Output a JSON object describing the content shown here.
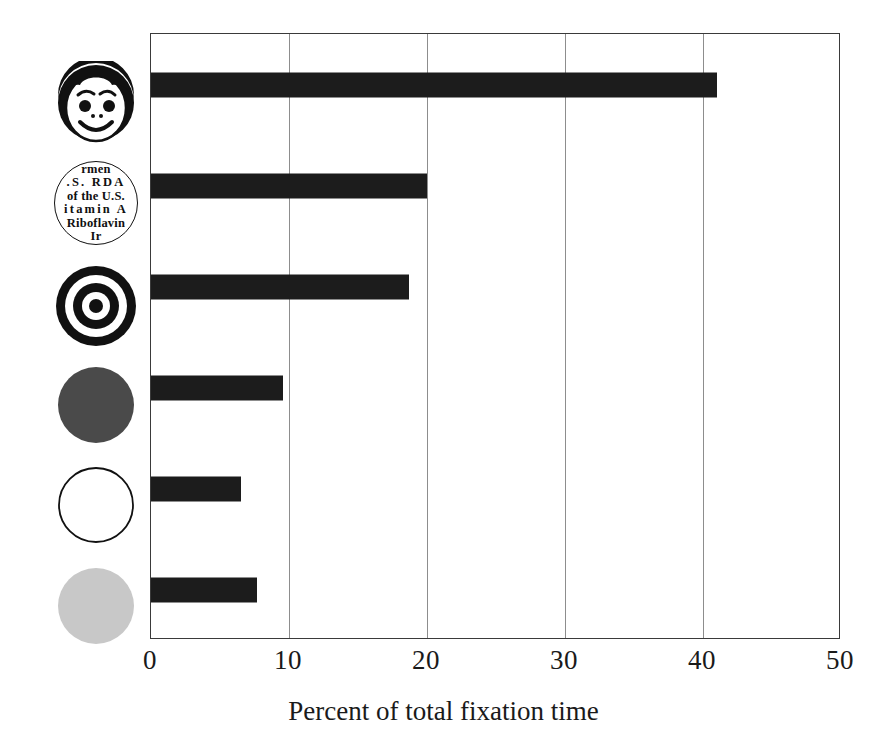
{
  "chart_data": {
    "type": "bar",
    "orientation": "horizontal",
    "title": "",
    "xlabel": "Percent of total fixation time",
    "ylabel": "",
    "xlim": [
      0,
      50
    ],
    "xticks": [
      0,
      10,
      20,
      30,
      40,
      50
    ],
    "xtick_labels": [
      "0",
      "10",
      "20",
      "30",
      "40",
      "50"
    ],
    "grid": "vertical",
    "legend": "none",
    "bar_color": "#1c1c1c",
    "categories": [
      "smiling-face",
      "nutrition-label",
      "bullseye-target",
      "dark-gray-circle",
      "white-circle",
      "light-gray-circle"
    ],
    "values": [
      41.0,
      20.0,
      18.7,
      9.6,
      6.5,
      7.7
    ],
    "bars": [
      {
        "category": "smiling-face",
        "value": 41.0,
        "icon": "smiling-face-icon"
      },
      {
        "category": "nutrition-label",
        "value": 20.0,
        "icon": "nutrition-label-icon"
      },
      {
        "category": "bullseye-target",
        "value": 18.7,
        "icon": "bullseye-target-icon"
      },
      {
        "category": "dark-gray-circle",
        "value": 9.6,
        "icon": "dark-gray-circle-icon"
      },
      {
        "category": "white-circle",
        "value": 6.5,
        "icon": "white-circle-icon"
      },
      {
        "category": "light-gray-circle",
        "value": 7.7,
        "icon": "light-gray-circle-icon"
      }
    ]
  },
  "icons": {
    "nutrition_label": {
      "lines": [
        "rmen",
        ".S.  RDA",
        "of the U.S.",
        "itamin  A",
        "Riboflavin",
        "Ir"
      ]
    }
  },
  "colors": {
    "bar": "#1c1c1c",
    "axis": "#3a3a3a",
    "gridline": "#8d8d8d",
    "dark_gray_circle": "#4a4a4a",
    "light_gray_circle": "#c8c8c8",
    "background": "#ffffff",
    "text": "#1a1a1a"
  }
}
